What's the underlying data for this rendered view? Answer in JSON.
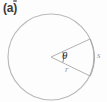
{
  "figure": {
    "panel_label": "(a)",
    "labels": {
      "angle": "θ",
      "radius": "r",
      "arc": "s"
    },
    "colors": {
      "circle_stroke": "#b9b9b9",
      "radius_stroke": "#b3b3b3",
      "angle_arc_stroke": "#8a8a8a",
      "panel_label": "#3a3a3a",
      "background": "#fdfdfd"
    },
    "geometry": {
      "center_x": 51,
      "center_y": 57,
      "radius_px": 43,
      "upper_radius_endpoint_x": 90,
      "upper_radius_endpoint_y": 39,
      "lower_radius_endpoint_x": 90,
      "lower_radius_endpoint_y": 76,
      "angle_arc_radius_px": 13
    }
  }
}
